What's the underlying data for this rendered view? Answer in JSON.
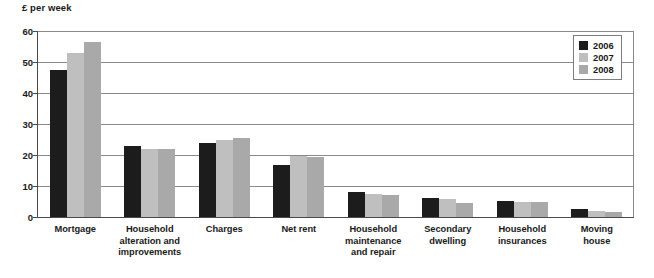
{
  "chart_data": {
    "type": "bar",
    "title": "",
    "ylabel": "£ per week",
    "xlabel": "",
    "ylim": [
      0,
      60
    ],
    "yticks": [
      0,
      10,
      20,
      30,
      40,
      50,
      60
    ],
    "grid": true,
    "legend_position": "top-right",
    "categories": [
      "Mortgage",
      "Household alteration and improvements",
      "Charges",
      "Net rent",
      "Household maintenance and repair",
      "Secondary dwelling",
      "Household insurances",
      "Moving house"
    ],
    "category_lines": [
      [
        "Mortgage"
      ],
      [
        "Household",
        "alteration and",
        "improvements"
      ],
      [
        "Charges"
      ],
      [
        "Net rent"
      ],
      [
        "Household",
        "maintenance",
        "and repair"
      ],
      [
        "Secondary",
        "dwelling"
      ],
      [
        "Household",
        "insurances"
      ],
      [
        "Moving",
        "house"
      ]
    ],
    "series": [
      {
        "name": "2006",
        "color": "#1c1c1c",
        "values": [
          47.5,
          22.8,
          24.0,
          16.8,
          8.1,
          6.0,
          5.1,
          2.7
        ]
      },
      {
        "name": "2007",
        "color": "#bfbfbf",
        "values": [
          53.0,
          21.8,
          25.0,
          19.8,
          7.5,
          5.7,
          5.0,
          2.0
        ]
      },
      {
        "name": "2008",
        "color": "#a9a9a9",
        "values": [
          56.5,
          21.8,
          25.5,
          19.2,
          7.0,
          4.4,
          5.0,
          1.6
        ]
      }
    ]
  },
  "legend": {
    "items": [
      {
        "label": "2006",
        "color": "#1c1c1c"
      },
      {
        "label": "2007",
        "color": "#bfbfbf"
      },
      {
        "label": "2008",
        "color": "#a9a9a9"
      }
    ]
  },
  "axis": {
    "y_title": "£ per week",
    "y_ticks": [
      "60",
      "50",
      "40",
      "30",
      "20",
      "10",
      "0"
    ]
  }
}
